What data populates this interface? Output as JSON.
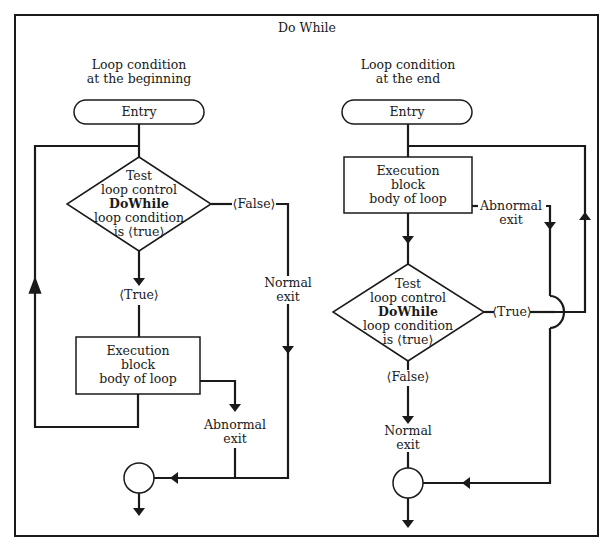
{
  "title": "Do While",
  "left": {
    "heading": [
      "Loop condition",
      "at the beginning"
    ],
    "entry": "Entry",
    "test": [
      "Test",
      "loop control",
      "DoWhile",
      "loop condition",
      "is ⟨true⟩"
    ],
    "false_label": "⟨False⟩",
    "true_label": "⟨True⟩",
    "execution": [
      "Execution",
      "block",
      "body of loop"
    ],
    "normal_exit": [
      "Normal",
      "exit"
    ],
    "abnormal_exit": [
      "Abnormal",
      "exit"
    ]
  },
  "right": {
    "heading": [
      "Loop condition",
      "at the end"
    ],
    "entry": "Entry",
    "execution": [
      "Execution",
      "block",
      "body of loop"
    ],
    "abnormal_exit": [
      "Abnormal",
      "exit"
    ],
    "test": [
      "Test",
      "loop control",
      "DoWhile",
      "loop condition",
      "is ⟨true⟩"
    ],
    "true_label": "⟨True⟩",
    "false_label": "⟨False⟩",
    "normal_exit": [
      "Normal",
      "exit"
    ]
  },
  "colors": {
    "stroke": "#1a1a1a",
    "background": "#ffffff"
  }
}
